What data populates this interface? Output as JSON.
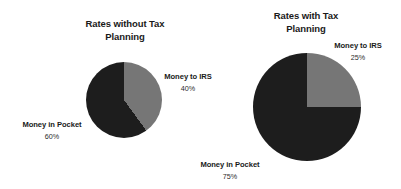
{
  "figure": {
    "background_color": "#ffffff",
    "width": 401,
    "height": 189
  },
  "charts": {
    "left": {
      "title_line1": "Rates without Tax",
      "title_line2": "Planning",
      "labels": {
        "irs_name": "Money to IRS",
        "irs_value": "40%",
        "pocket_name": "Money in Pocket",
        "pocket_value": "60%"
      }
    },
    "right": {
      "title_line1": "Rates with Tax",
      "title_line2": "Planning",
      "labels": {
        "irs_name": "Money to IRS",
        "irs_value": "25%",
        "pocket_name": "Money in Pocket",
        "pocket_value": "75%"
      }
    }
  },
  "colors": {
    "slice_irs": "#767676",
    "slice_pocket": "#1d1d1d",
    "text": "#1a1a1a",
    "background": "#ffffff"
  },
  "chart_data": [
    {
      "type": "pie",
      "title": "Rates without Tax Planning",
      "categories": [
        "Money to IRS",
        "Money in Pocket"
      ],
      "values": [
        40,
        60
      ],
      "value_labels": [
        "40%",
        "60%"
      ],
      "colors": [
        "#767676",
        "#1d1d1d"
      ],
      "start_angle_deg": 0,
      "direction": "clockwise",
      "legend": "none",
      "labels_position": "outside",
      "xlabel": "",
      "ylabel": ""
    },
    {
      "type": "pie",
      "title": "Rates with Tax Planning",
      "categories": [
        "Money to IRS",
        "Money in Pocket"
      ],
      "values": [
        25,
        75
      ],
      "value_labels": [
        "25%",
        "75%"
      ],
      "colors": [
        "#767676",
        "#1d1d1d"
      ],
      "start_angle_deg": 0,
      "direction": "clockwise",
      "legend": "none",
      "labels_position": "outside",
      "xlabel": "",
      "ylabel": ""
    }
  ]
}
